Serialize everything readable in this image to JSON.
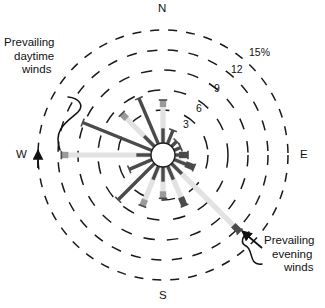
{
  "figure": {
    "type": "wind-rose",
    "center_x": 163,
    "center_y": 155,
    "hub_radius": 12
  },
  "cardinals": {
    "north": "N",
    "south": "S",
    "east": "E",
    "west": "W"
  },
  "ring_labels": [
    {
      "text": "15%",
      "radius": 125,
      "x": 251,
      "y": 52
    },
    {
      "text": "12",
      "radius": 105,
      "x": 234,
      "y": 69
    },
    {
      "text": "9",
      "radius": 85,
      "x": 217,
      "y": 88
    },
    {
      "text": "6",
      "radius": 65,
      "x": 199,
      "y": 108
    },
    {
      "text": "3",
      "radius": 45,
      "x": 186,
      "y": 124
    }
  ],
  "annotations": [
    {
      "id": "prevailing-daytime-winds",
      "lines": [
        "Prevailing",
        "daytime",
        "winds"
      ],
      "x": 4,
      "y": 38,
      "points_to": "W"
    },
    {
      "id": "prevailing-evening-winds",
      "lines": [
        "Prevailing",
        "evening",
        "winds"
      ],
      "x": 266,
      "y": 235,
      "points_to": "SE"
    }
  ],
  "chart_data": {
    "type": "wind-rose",
    "title": "",
    "xlabel": "",
    "ylabel": "Frequency (%)",
    "rlim": [
      0,
      15
    ],
    "r_ticks": [
      3,
      6,
      9,
      12,
      15
    ],
    "r_tick_labels": [
      "3",
      "6",
      "9",
      "12",
      "15%"
    ],
    "grid": "dashed-circles",
    "legend": "none",
    "units": "percent",
    "directions": [
      "N",
      "NNE",
      "NE",
      "ENE",
      "E",
      "ESE",
      "SE",
      "SSE",
      "S",
      "SSW",
      "SW",
      "WSW",
      "W",
      "WNW",
      "NW",
      "NNW"
    ],
    "series": [
      {
        "name": "Wind frequency",
        "values": [
          6.6,
          3.2,
          2.3,
          2.3,
          3.0,
          4.0,
          13.0,
          6.6,
          5.2,
          6.6,
          7.6,
          4.4,
          12.2,
          10.4,
          7.0,
          7.4
        ]
      }
    ],
    "petals": [
      {
        "dir": "N",
        "angle_deg": 0,
        "value": 6.6,
        "shade": "light",
        "tip": "mid"
      },
      {
        "dir": "NNE",
        "angle_deg": 22,
        "value": 3.2,
        "shade": "dark",
        "tip": "none"
      },
      {
        "dir": "NE",
        "angle_deg": 45,
        "value": 2.3,
        "shade": "dark",
        "tip": "none"
      },
      {
        "dir": "ENE",
        "angle_deg": 67,
        "value": 2.3,
        "shade": "dark",
        "tip": "none"
      },
      {
        "dir": "E",
        "angle_deg": 90,
        "value": 3.0,
        "shade": "light",
        "tip": "dark"
      },
      {
        "dir": "ESE",
        "angle_deg": 112,
        "value": 4.0,
        "shade": "light",
        "tip": "dark"
      },
      {
        "dir": "SE",
        "angle_deg": 135,
        "value": 13.0,
        "shade": "light",
        "tip": "dark"
      },
      {
        "dir": "SSE",
        "angle_deg": 157,
        "value": 6.6,
        "shade": "light",
        "tip": "dark"
      },
      {
        "dir": "S",
        "angle_deg": 180,
        "value": 5.2,
        "shade": "light",
        "tip": "mid"
      },
      {
        "dir": "SSW",
        "angle_deg": 202,
        "value": 6.6,
        "shade": "light",
        "tip": "mid"
      },
      {
        "dir": "SW",
        "angle_deg": 225,
        "value": 7.6,
        "shade": "dark",
        "tip": "none"
      },
      {
        "dir": "WSW",
        "angle_deg": 247,
        "value": 4.4,
        "shade": "dark",
        "tip": "none"
      },
      {
        "dir": "W",
        "angle_deg": 270,
        "value": 12.2,
        "shade": "light",
        "tip": "mid"
      },
      {
        "dir": "WNW",
        "angle_deg": 292,
        "value": 10.4,
        "shade": "dark",
        "tip": "none"
      },
      {
        "dir": "NW",
        "angle_deg": 315,
        "value": 7.0,
        "shade": "light",
        "tip": "mid"
      },
      {
        "dir": "NNW",
        "angle_deg": 337,
        "value": 7.4,
        "shade": "dark",
        "tip": "none"
      }
    ]
  },
  "colors": {
    "ink": "#111111",
    "grid": "#1a1a1a",
    "petal_light": "#e2e2e2",
    "petal_mid": "#9a9a9a",
    "petal_dark": "#4a4a4a",
    "hub_fill": "#ffffff",
    "background": "#ffffff"
  }
}
